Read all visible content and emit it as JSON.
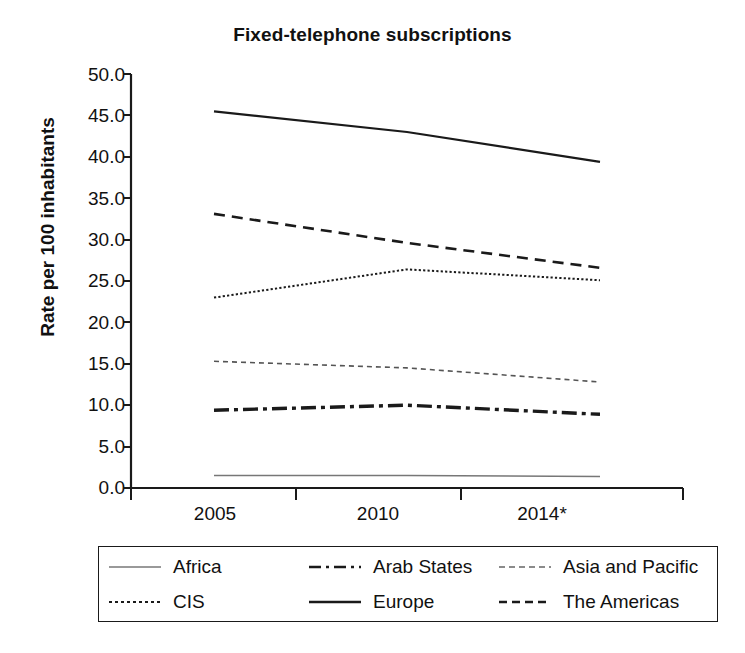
{
  "chart_data": {
    "type": "line",
    "title": "Fixed-telephone subscriptions",
    "xlabel": "",
    "ylabel": "Rate per 100 inhabitants",
    "categories": [
      "2005",
      "2010",
      "2014*"
    ],
    "x_tick_labels": [
      "2005",
      "2010",
      "2014*"
    ],
    "y_tick_labels": [
      "0.0",
      "5.0",
      "10.0",
      "15.0",
      "20.0",
      "25.0",
      "30.0",
      "35.0",
      "40.0",
      "45.0",
      "50.0"
    ],
    "y_ticks": [
      0,
      5,
      10,
      15,
      20,
      25,
      30,
      35,
      40,
      45,
      50
    ],
    "ylim": [
      0,
      50
    ],
    "grid": false,
    "legend_position": "bottom",
    "series": [
      {
        "name": "Africa",
        "values": [
          1.5,
          1.5,
          1.4
        ],
        "style": "thin-solid"
      },
      {
        "name": "Arab States",
        "values": [
          9.4,
          10.0,
          8.9
        ],
        "style": "dash-dot"
      },
      {
        "name": "Asia and Pacific",
        "values": [
          15.3,
          14.5,
          12.8
        ],
        "style": "fine-dash"
      },
      {
        "name": "CIS",
        "values": [
          23.0,
          26.4,
          25.1
        ],
        "style": "dotted"
      },
      {
        "name": "Europe",
        "values": [
          45.5,
          43.0,
          39.4
        ],
        "style": "solid"
      },
      {
        "name": "The Americas",
        "values": [
          33.1,
          29.6,
          26.6
        ],
        "style": "dashed"
      }
    ]
  },
  "legend": {
    "entries": [
      {
        "label": "Africa"
      },
      {
        "label": "Arab States"
      },
      {
        "label": "Asia and Pacific"
      },
      {
        "label": "CIS"
      },
      {
        "label": "Europe"
      },
      {
        "label": "The Americas"
      }
    ]
  },
  "axes": {
    "y_labels": [
      "50.0",
      "45.0",
      "40.0",
      "35.0",
      "30.0",
      "25.0",
      "20.0",
      "15.0",
      "10.0",
      "5.0",
      "0.0"
    ],
    "x_labels": [
      "2005",
      "2010",
      "2014*"
    ]
  },
  "colors": {
    "ink": "#1a1a1a",
    "background": "#ffffff"
  }
}
